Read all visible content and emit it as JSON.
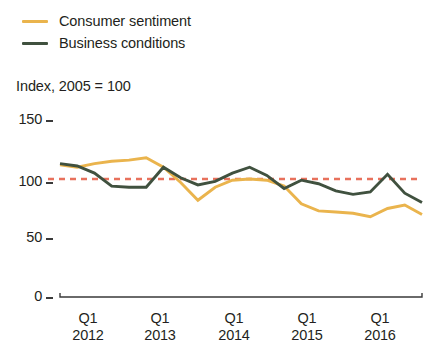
{
  "legend": {
    "position": "top-left",
    "items": [
      {
        "label": "Consumer sentiment",
        "color": "#eab44d",
        "key": "consumer_sentiment"
      },
      {
        "label": "Business conditions",
        "color": "#40513f",
        "key": "business_conditions"
      }
    ]
  },
  "axis_title": "Index, 2005 = 100",
  "reference_line": {
    "value": 100,
    "color": "#e8715c",
    "style": "dashed"
  },
  "y_ticks": [
    "0",
    "50",
    "100",
    "150"
  ],
  "x_ticks": [
    {
      "q": "Q1",
      "yr": "2012"
    },
    {
      "q": "Q1",
      "yr": "2013"
    },
    {
      "q": "Q1",
      "yr": "2014"
    },
    {
      "q": "Q1",
      "yr": "2015"
    },
    {
      "q": "Q1",
      "yr": "2016"
    }
  ],
  "chart_data": {
    "type": "line",
    "title": "",
    "subtitle": "",
    "xlabel": "",
    "ylabel": "Index, 2005 = 100",
    "ylim": [
      0,
      150
    ],
    "yticks": [
      0,
      50,
      100,
      150
    ],
    "grid": false,
    "legend_position": "top-left",
    "reference_lines": [
      {
        "axis": "y",
        "value": 100,
        "color": "#e8715c",
        "style": "dashed"
      }
    ],
    "x": [
      "2011 Q3",
      "2011 Q4",
      "2012 Q1",
      "2012 Q2",
      "2012 Q3",
      "2012 Q4",
      "2013 Q1",
      "2013 Q2",
      "2013 Q3",
      "2013 Q4",
      "2014 Q1",
      "2014 Q2",
      "2014 Q3",
      "2014 Q4",
      "2015 Q1",
      "2015 Q2",
      "2015 Q3",
      "2015 Q4",
      "2016 Q1",
      "2016 Q2",
      "2016 Q3",
      "2016 Q4"
    ],
    "xtick_labels": [
      "Q1 2012",
      "Q1 2013",
      "Q1 2014",
      "Q1 2015",
      "Q1 2016"
    ],
    "series": [
      {
        "name": "Consumer sentiment",
        "color": "#eab44d",
        "values": [
          112,
          110,
          113,
          115,
          116,
          118,
          110,
          97,
          82,
          93,
          99,
          100,
          99,
          94,
          79,
          73,
          72,
          71,
          68,
          75,
          78,
          70
        ]
      },
      {
        "name": "Business conditions",
        "color": "#40513f",
        "values": [
          113,
          111,
          105,
          94,
          93,
          93,
          110,
          101,
          95,
          98,
          105,
          110,
          103,
          92,
          99,
          96,
          90,
          87,
          89,
          104,
          88,
          80
        ]
      }
    ]
  }
}
